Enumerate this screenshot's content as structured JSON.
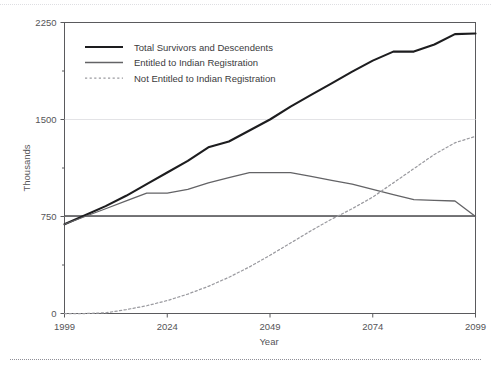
{
  "chart_data": {
    "type": "line",
    "title": "",
    "xlabel": "Year",
    "ylabel": "Thousands",
    "xlim": [
      1999,
      2099
    ],
    "ylim": [
      0,
      2250
    ],
    "xticks": [
      "1999",
      "2024",
      "2049",
      "2074",
      "2099"
    ],
    "yticks": [
      "0",
      "750",
      "1500",
      "2250"
    ],
    "grid": "horizontal-major-light",
    "legend_position": "top-left-inside",
    "reference_line": {
      "label": "750",
      "value": 750
    },
    "series": [
      {
        "name": "Total Survivors and Descendents",
        "style": "solid-thick",
        "color": "#1d1d1f",
        "x": [
          1999,
          2004,
          2009,
          2014,
          2019,
          2024,
          2029,
          2034,
          2039,
          2044,
          2049,
          2054,
          2059,
          2064,
          2069,
          2074,
          2079,
          2084,
          2089,
          2094,
          2099
        ],
        "values": [
          690,
          760,
          830,
          910,
          1000,
          1090,
          1180,
          1285,
          1330,
          1415,
          1500,
          1600,
          1690,
          1780,
          1870,
          1955,
          2025,
          2025,
          2080,
          2160,
          2165
        ]
      },
      {
        "name": "Entitled to Indian Registration",
        "style": "solid-thin",
        "color": "#636366",
        "x": [
          1999,
          2004,
          2009,
          2014,
          2019,
          2024,
          2029,
          2034,
          2039,
          2044,
          2049,
          2054,
          2059,
          2064,
          2069,
          2074,
          2079,
          2084,
          2089,
          2094,
          2099
        ],
        "values": [
          690,
          750,
          810,
          870,
          930,
          930,
          960,
          1010,
          1050,
          1090,
          1090,
          1090,
          1060,
          1030,
          1000,
          960,
          920,
          880,
          875,
          870,
          750
        ]
      },
      {
        "name": "Not Entitled to Indian Registration",
        "style": "dotted",
        "color": "#9b9ba0",
        "x": [
          1999,
          2004,
          2009,
          2014,
          2019,
          2024,
          2029,
          2034,
          2039,
          2044,
          2049,
          2054,
          2059,
          2064,
          2069,
          2074,
          2079,
          2084,
          2089,
          2094,
          2099
        ],
        "values": [
          0,
          0,
          5,
          30,
          60,
          100,
          150,
          210,
          280,
          360,
          450,
          545,
          640,
          730,
          810,
          900,
          1010,
          1120,
          1230,
          1320,
          1370
        ]
      }
    ]
  },
  "legend": {
    "items": [
      {
        "label": "Total Survivors and Descendents",
        "swatch": "solid-thick"
      },
      {
        "label": "Entitled to Indian Registration",
        "swatch": "solid-thin"
      },
      {
        "label": "Not Entitled to Indian Registration",
        "swatch": "dotted"
      }
    ]
  },
  "colors": {
    "total": "#1d1d1f",
    "entitled": "#636366",
    "not_entitled": "#9b9ba0",
    "axis": "#5a5a5d",
    "grid": "#e3e3e6",
    "reference": "#4a4a4d"
  }
}
